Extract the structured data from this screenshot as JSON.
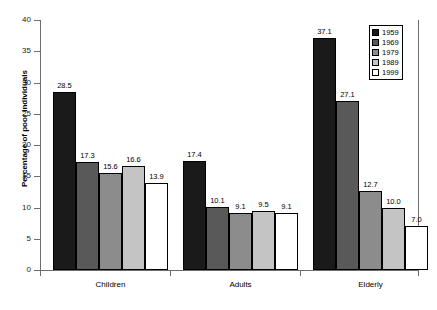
{
  "chart_data": {
    "type": "bar",
    "title": "",
    "xlabel": "",
    "ylabel": "Percentage of poor individuals",
    "ylim": [
      0,
      40
    ],
    "ytick_step": 5,
    "yticks": [
      0,
      5,
      10,
      15,
      20,
      25,
      30,
      35,
      40
    ],
    "ytick_labels": [
      "0",
      "5",
      "10",
      "15",
      "20",
      "25",
      "30",
      "35",
      "40"
    ],
    "grid": false,
    "legend_position": "top-right",
    "categories": [
      "Children",
      "Adults",
      "Elderly"
    ],
    "series": [
      {
        "name": "1959",
        "color": "#1a1a1a",
        "values": [
          28.5,
          17.4,
          37.1
        ]
      },
      {
        "name": "1969",
        "color": "#595959",
        "values": [
          17.3,
          10.1,
          27.1
        ]
      },
      {
        "name": "1979",
        "color": "#8c8c8c",
        "values": [
          15.6,
          9.1,
          12.7
        ]
      },
      {
        "name": "1989",
        "color": "#c4c4c4",
        "values": [
          16.6,
          9.5,
          10.0
        ]
      },
      {
        "name": "1999",
        "color": "#ffffff",
        "values": [
          13.9,
          9.1,
          7.0
        ]
      }
    ],
    "data_labels": [
      [
        "28.5",
        "17.3",
        "15.6",
        "16.6",
        "13.9"
      ],
      [
        "17.4",
        "10.1",
        "9.1",
        "9.5",
        "9.1"
      ],
      [
        "37.1",
        "27.1",
        "12.7",
        "10.0",
        "7.0"
      ]
    ],
    "axis_color": "#6e6e6e",
    "bar_border_color": "#000000",
    "background_color": "#ffffff"
  },
  "legend": {
    "entries": [
      "1959",
      "1969",
      "1979",
      "1989",
      "1999"
    ]
  }
}
